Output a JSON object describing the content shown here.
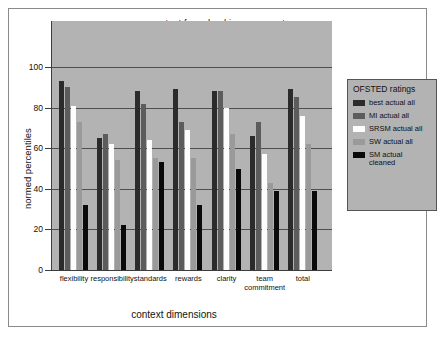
{
  "chart_data": {
    "type": "bar",
    "title": "context for school improvement",
    "xlabel": "context dimensions",
    "ylabel": "normed percentiles",
    "ylim": [
      0,
      100
    ],
    "yticks": [
      0,
      20,
      40,
      60,
      80,
      100
    ],
    "grid": true,
    "legend_title": "OFSTED ratings",
    "legend_position": "right",
    "categories": [
      "flexibility",
      "responsibility",
      "standards",
      "rewards",
      "clarity",
      "team\ncommitment",
      "total"
    ],
    "series": [
      {
        "name": "best actual all",
        "color": "#2b2b2b",
        "values": [
          93,
          65,
          88,
          89,
          88,
          66,
          89
        ]
      },
      {
        "name": "MI actual all",
        "color": "#5c5c5c",
        "values": [
          90,
          67,
          82,
          73,
          88,
          73,
          85
        ]
      },
      {
        "name": "SRSM actual all",
        "color": "#fdfdfd",
        "values": [
          81,
          62,
          64,
          69,
          80,
          57,
          76
        ]
      },
      {
        "name": "SW actual all",
        "color": "#9a9a9a",
        "values": [
          73,
          54,
          55,
          55,
          67,
          43,
          62
        ]
      },
      {
        "name": "SM actual\ncleaned",
        "color": "#0a0a0a",
        "values": [
          32,
          22,
          53,
          32,
          50,
          39,
          39
        ]
      }
    ]
  }
}
